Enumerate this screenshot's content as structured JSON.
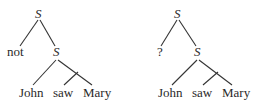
{
  "trees": [
    {
      "root": "S",
      "left_child": "not",
      "right_child": "S",
      "leaves": [
        "John",
        "saw",
        "Mary"
      ]
    },
    {
      "root": "S",
      "left_child": "?",
      "right_child": "S",
      "leaves": [
        "John",
        "saw",
        "Mary"
      ]
    }
  ],
  "colors": {
    "text": "#2a2a2a",
    "lines": "#333333",
    "background": "#ffffff"
  }
}
